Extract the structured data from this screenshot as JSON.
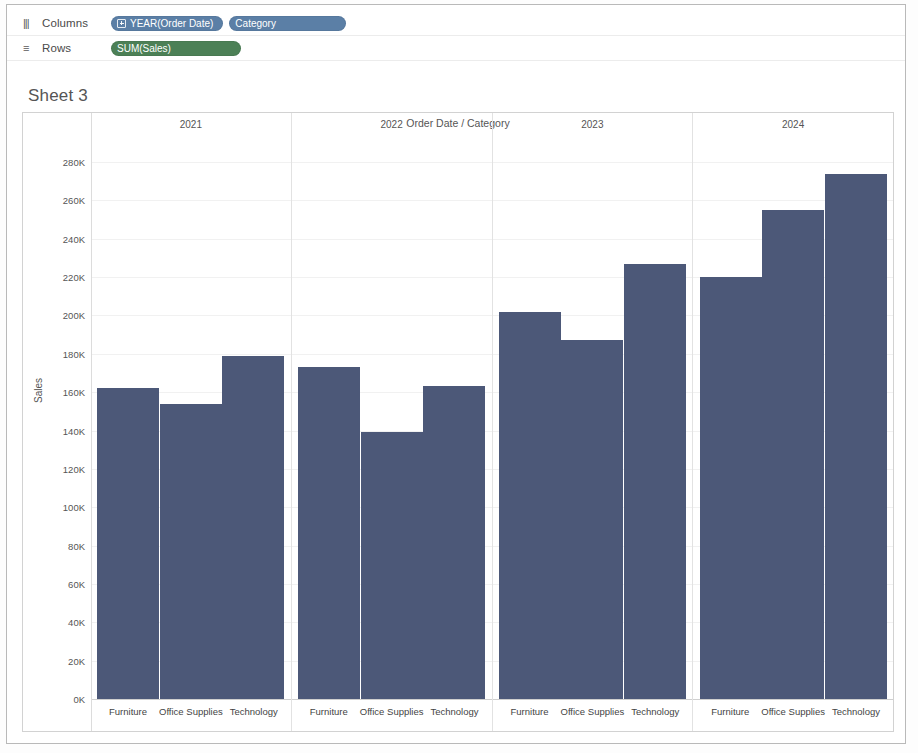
{
  "shelves": {
    "columns": {
      "label": "Columns",
      "icon": "columns-icon",
      "pills": [
        {
          "text": "YEAR(Order Date)",
          "color": "#5b7fa6",
          "icon": "expand-plus-icon"
        },
        {
          "text": "Category",
          "color": "#5b7fa6",
          "icon": "dimension-bars-icon"
        }
      ]
    },
    "rows": {
      "label": "Rows",
      "icon": "rows-icon",
      "pills": [
        {
          "text": "SUM(Sales)",
          "color": "#4c8056",
          "icon": ""
        }
      ]
    }
  },
  "sheet": {
    "title": "Sheet 3"
  },
  "chart_data": {
    "type": "bar",
    "title": "Order Date / Category",
    "xlabel": "",
    "ylabel": "Sales",
    "ylim": [
      0,
      280000
    ],
    "ytick_labels": [
      "280K",
      "260K",
      "240K",
      "220K",
      "200K",
      "180K",
      "160K",
      "140K",
      "120K",
      "100K",
      "80K",
      "60K",
      "40K",
      "20K",
      "0K"
    ],
    "ytick_values": [
      280000,
      260000,
      240000,
      220000,
      200000,
      180000,
      160000,
      140000,
      120000,
      100000,
      80000,
      60000,
      40000,
      20000,
      0
    ],
    "grid": true,
    "legend": "none",
    "bar_color": "#4c5878",
    "panel_field": "Order Date",
    "panels": [
      "2021",
      "2022",
      "2023",
      "2024"
    ],
    "categories": [
      "Furniture",
      "Office Supplies",
      "Technology"
    ],
    "series": [
      {
        "name": "2021",
        "values": [
          162000,
          154000,
          179000
        ]
      },
      {
        "name": "2022",
        "values": [
          173000,
          139000,
          163000
        ]
      },
      {
        "name": "2023",
        "values": [
          202000,
          187000,
          227000
        ]
      },
      {
        "name": "2024",
        "values": [
          220000,
          255000,
          274000
        ]
      }
    ]
  }
}
